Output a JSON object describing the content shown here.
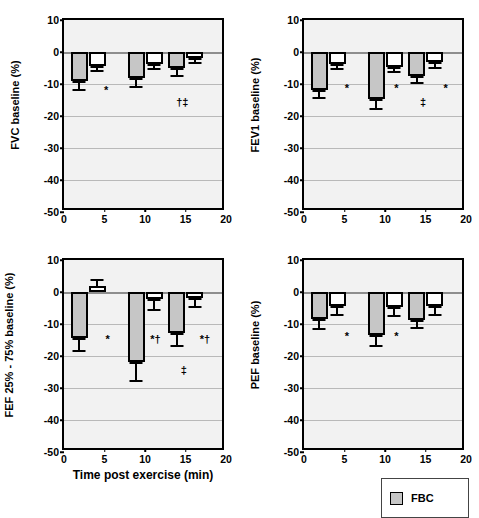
{
  "figure": {
    "xlabel": "Time post exercise (min)",
    "legend": [
      {
        "label": "FBC",
        "color": "#c6c6c6",
        "name": "legend-item-fbc"
      }
    ]
  },
  "chart_data": [
    {
      "type": "bar",
      "panel": "top-left",
      "title": "",
      "ylabel": "FVC baseline (%)",
      "xlabel": "",
      "ylim": [
        -50,
        10
      ],
      "xlim": [
        0,
        20
      ],
      "yticks": [
        10,
        0,
        -10,
        -20,
        -30,
        -40,
        -50
      ],
      "xticks": [
        0,
        5,
        10,
        15,
        20
      ],
      "grid": true,
      "categories": [
        3,
        10,
        15
      ],
      "series": [
        {
          "name": "FBC",
          "color": "#c6c6c6",
          "values": [
            -9.0,
            -8.0,
            -5.0
          ],
          "errors": [
            2.5,
            2.7,
            2.3
          ]
        },
        {
          "name": "Control",
          "color": "#ffffff",
          "values": [
            -4.3,
            -3.8,
            -2.0
          ],
          "errors": [
            1.4,
            1.2,
            1.1
          ]
        }
      ],
      "annotations": [
        {
          "text": "*",
          "x": 5.2,
          "y": -10.2
        },
        {
          "text": "†‡",
          "x": 14.6,
          "y": -14.0
        }
      ]
    },
    {
      "type": "bar",
      "panel": "top-right",
      "title": "",
      "ylabel": "FEV1 baseline (%)",
      "xlabel": "",
      "ylim": [
        -50,
        10
      ],
      "xlim": [
        0,
        20
      ],
      "yticks": [
        10,
        0,
        -10,
        -20,
        -30,
        -40,
        -50
      ],
      "xticks": [
        0,
        5,
        10,
        15,
        20
      ],
      "grid": true,
      "categories": [
        3,
        10,
        15
      ],
      "series": [
        {
          "name": "FBC",
          "color": "#c6c6c6",
          "values": [
            -12.0,
            -14.7,
            -7.5
          ],
          "errors": [
            2.1,
            2.7,
            1.9
          ]
        },
        {
          "name": "Control",
          "color": "#ffffff",
          "values": [
            -3.8,
            -4.6,
            -3.0
          ],
          "errors": [
            1.3,
            1.2,
            1.8
          ]
        }
      ],
      "annotations": [
        {
          "text": "*",
          "x": 5.3,
          "y": -9.7
        },
        {
          "text": "*",
          "x": 11.4,
          "y": -9.7
        },
        {
          "text": "*",
          "x": 17.5,
          "y": -9.7
        },
        {
          "text": "‡",
          "x": 14.7,
          "y": -14.0
        }
      ]
    },
    {
      "type": "bar",
      "panel": "bottom-left",
      "title": "",
      "ylabel": "FEF 25% - 75% baseline (%)",
      "xlabel": "Time post exercise (min)",
      "ylim": [
        -50,
        10
      ],
      "xlim": [
        0,
        20
      ],
      "yticks": [
        10,
        0,
        -10,
        -20,
        -30,
        -40,
        -50
      ],
      "xticks": [
        0,
        5,
        10,
        15,
        20
      ],
      "grid": true,
      "categories": [
        3,
        10,
        15
      ],
      "series": [
        {
          "name": "FBC",
          "color": "#c6c6c6",
          "values": [
            -14.5,
            -22.0,
            -12.8
          ],
          "errors": [
            3.6,
            5.6,
            3.8
          ]
        },
        {
          "name": "Control",
          "color": "#ffffff",
          "values": [
            1.8,
            -2.2,
            -2.0
          ],
          "errors": [
            2.4,
            3.2,
            2.4
          ]
        }
      ],
      "annotations": [
        {
          "text": "*",
          "x": 5.4,
          "y": -13.2
        },
        {
          "text": "*†",
          "x": 11.3,
          "y": -13.2
        },
        {
          "text": "*†",
          "x": 17.4,
          "y": -13.2
        },
        {
          "text": "‡",
          "x": 14.8,
          "y": -22.8
        }
      ]
    },
    {
      "type": "bar",
      "panel": "bottom-right",
      "title": "",
      "ylabel": "PEF baseline (%)",
      "xlabel": "",
      "ylim": [
        -50,
        10
      ],
      "xlim": [
        0,
        20
      ],
      "yticks": [
        10,
        0,
        -10,
        -20,
        -30,
        -40,
        -50
      ],
      "xticks": [
        0,
        5,
        10,
        15,
        20
      ],
      "grid": true,
      "categories": [
        3,
        10,
        15
      ],
      "series": [
        {
          "name": "FBC",
          "color": "#c6c6c6",
          "values": [
            -8.4,
            -13.5,
            -8.8
          ],
          "errors": [
            2.7,
            3.2,
            2.0
          ]
        },
        {
          "name": "Control",
          "color": "#ffffff",
          "values": [
            -4.3,
            -4.8,
            -4.3
          ],
          "errors": [
            2.5,
            2.5,
            2.6
          ]
        }
      ],
      "annotations": [
        {
          "text": "*",
          "x": 5.3,
          "y": -12.1
        },
        {
          "text": "*",
          "x": 11.4,
          "y": -12.1
        }
      ]
    }
  ]
}
